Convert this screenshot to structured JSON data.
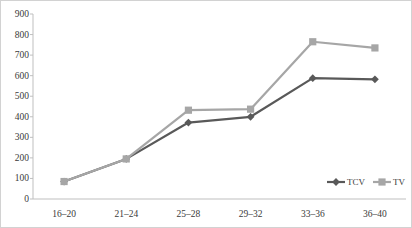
{
  "chart_data": {
    "type": "line",
    "title": "",
    "xlabel": "",
    "ylabel": "",
    "categories": [
      "16–20",
      "21–24",
      "25–28",
      "29–32",
      "33–36",
      "36–40"
    ],
    "series": [
      {
        "name": "TCV",
        "values": [
          85,
          195,
          372,
          400,
          588,
          582
        ],
        "color": "#595959",
        "marker": "diamond"
      },
      {
        "name": "TV",
        "values": [
          85,
          195,
          432,
          437,
          765,
          735
        ],
        "color": "#a6a6a6",
        "marker": "square"
      }
    ],
    "yticks": [
      0,
      100,
      200,
      300,
      400,
      500,
      600,
      700,
      800,
      900
    ],
    "ylim": [
      0,
      900
    ],
    "grid": false,
    "legend_position": "bottom-right-inside",
    "axis_color": "#bfbfbf",
    "border_color": "#d2d2d2"
  }
}
